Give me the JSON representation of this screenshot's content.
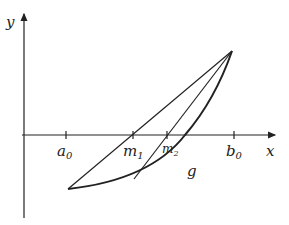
{
  "diagram": {
    "axes": {
      "x_label": "x",
      "y_label": "y"
    },
    "ticks": [
      {
        "name": "a",
        "sub": "0",
        "x": 66
      },
      {
        "name": "m",
        "sub": "1",
        "x": 133
      },
      {
        "name": "m",
        "sub": "2",
        "x": 167
      },
      {
        "name": "b",
        "sub": "0",
        "x": 234
      }
    ],
    "curve_label": "g",
    "colors": {
      "stroke": "#222222",
      "background": "#ffffff"
    }
  }
}
